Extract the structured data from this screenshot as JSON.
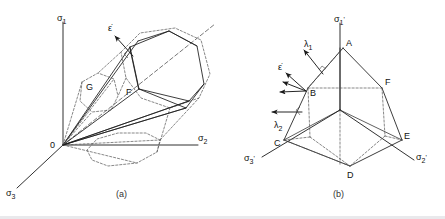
{
  "figure": {
    "title_a_caption": "(a)",
    "title_b_caption": "(b)",
    "colors": {
      "ink": "#1a1a1a",
      "dashed": "#555555",
      "background": "#ffffff"
    }
  },
  "panel_a": {
    "caption": "(a)",
    "axes": [
      {
        "name": "sigma-1",
        "label": "σ",
        "sub": "1"
      },
      {
        "name": "sigma-2",
        "label": "σ",
        "sub": "2"
      },
      {
        "name": "sigma-3",
        "label": "σ",
        "sub": "3"
      }
    ],
    "origin_label": "0",
    "surface_f_label": "F",
    "surface_g_label": "G",
    "strain_rate_label": "ε̇",
    "strain_rate_label_plain": "ε",
    "hydrostatic_axis_name": "hydrostatic-axis"
  },
  "panel_b": {
    "caption": "(b)",
    "axes": [
      {
        "name": "sigma-1-prime",
        "label": "σ",
        "sub": "1",
        "prime": "'"
      },
      {
        "name": "sigma-2-prime",
        "label": "σ",
        "sub": "2",
        "prime": "'"
      },
      {
        "name": "sigma-3-prime",
        "label": "σ",
        "sub": "3",
        "prime": "'"
      }
    ],
    "vertices": [
      {
        "name": "vertex-a",
        "label": "A"
      },
      {
        "name": "vertex-b",
        "label": "B"
      },
      {
        "name": "vertex-c",
        "label": "C"
      },
      {
        "name": "vertex-d",
        "label": "D"
      },
      {
        "name": "vertex-e",
        "label": "E"
      },
      {
        "name": "vertex-f",
        "label": "F"
      }
    ],
    "strain_rate_label": "ε̇",
    "lambda1_label": "λ",
    "lambda1_sub": "1",
    "lambda2_label": "λ",
    "lambda2_sub": "2",
    "dot_glyph": "̇"
  }
}
